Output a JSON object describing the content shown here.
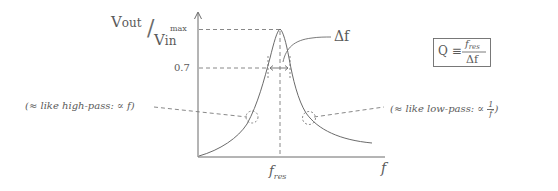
{
  "diagram": {
    "y_axis_label_num": "V",
    "y_axis_label_num_sub": "out",
    "y_axis_label_den": "V",
    "y_axis_label_den_sub": "in",
    "x_axis_label": "f",
    "y_ticks": [
      {
        "label": "max"
      },
      {
        "label": "0.7"
      }
    ],
    "x_ticks": [
      {
        "label": "f",
        "sub": "res"
      }
    ],
    "bandwidth_label": "Δf",
    "q_definition": {
      "lhs": "Q ≡",
      "numerator": "f",
      "numerator_sub": "res",
      "denominator": "Δf"
    },
    "annotations": {
      "left": "(≈ like high-pass: ∝ f)",
      "right_prefix": "(≈ like low-pass: ∝ ",
      "right_frac_num": "1",
      "right_frac_den": "f",
      "right_suffix": ")"
    },
    "colors": {
      "ink": "#5a5a5a",
      "curve": "#6b6b6b",
      "dash": "#7a7a7a",
      "background": "#ffffff"
    }
  }
}
